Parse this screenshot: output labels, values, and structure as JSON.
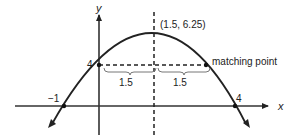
{
  "diagram": {
    "type": "parabola-graph",
    "axes": {
      "x_label": "x",
      "y_label": "y"
    },
    "vertex": {
      "label": "(1.5, 6.25)",
      "x": 1.5,
      "y": 6.25
    },
    "y_intercept": {
      "label": "4",
      "value": 4
    },
    "roots": [
      {
        "label": "−1",
        "value": -1
      },
      {
        "label": "4",
        "value": 4
      }
    ],
    "matching_point": {
      "label": "matching point",
      "x": 3,
      "y": 4
    },
    "distances": [
      {
        "label": "1.5"
      },
      {
        "label": "1.5"
      }
    ],
    "colors": {
      "stroke": "#222222",
      "background": "#ffffff"
    }
  }
}
